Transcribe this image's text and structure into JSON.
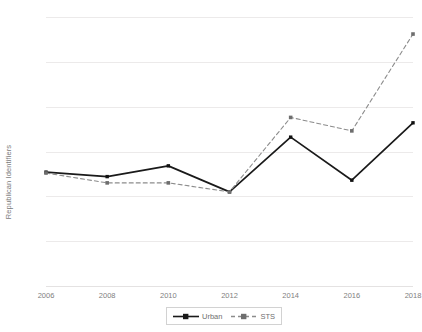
{
  "chart_data": {
    "type": "line",
    "title": "",
    "xlabel": "",
    "ylabel": "Republican Identifiers",
    "x": [
      2006,
      2008,
      2010,
      2012,
      2014,
      2016,
      2018
    ],
    "xtick_labels": [
      "2006",
      "2008",
      "2010",
      "2012",
      "2014",
      "2016",
      "2018"
    ],
    "ytick_labels": [
      "70%",
      "65%",
      "60%",
      "55%",
      "50%",
      "45%",
      "40%"
    ],
    "ytick_values": [
      70,
      65,
      60,
      55,
      50,
      45,
      40
    ],
    "ylim": [
      40,
      70
    ],
    "ylim_unit": "percent",
    "grid": true,
    "legend_position": "bottom-center",
    "series": [
      {
        "name": "Urban",
        "values": [
          52.7,
          52.2,
          53.4,
          50.5,
          56.6,
          51.8,
          58.2
        ],
        "color": "#1a1a1a",
        "line_style": "solid",
        "marker": "square"
      },
      {
        "name": "STS",
        "values": [
          52.6,
          51.5,
          51.5,
          50.5,
          58.8,
          57.3,
          68.1
        ],
        "color": "#8c8c8c",
        "line_style": "dashed",
        "marker": "square"
      }
    ]
  },
  "legend": {
    "entries": [
      {
        "label": "Urban"
      },
      {
        "label": "STS"
      }
    ]
  }
}
